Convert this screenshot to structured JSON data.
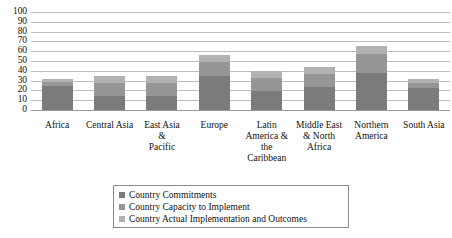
{
  "chart_data": {
    "type": "bar",
    "subtype": "stacked-bar",
    "title": "",
    "xlabel": "",
    "ylabel": "",
    "ylim": [
      0,
      100
    ],
    "y_ticks": [
      0,
      10,
      20,
      30,
      40,
      50,
      60,
      70,
      80,
      90,
      100
    ],
    "grid": true,
    "legend_position": "bottom",
    "categories": [
      "Africa",
      "Central Asia",
      "East Asia & Pacific",
      "Europe",
      "Latin America & the Caribbean",
      "Middle East & North Africa",
      "Northern America",
      "South Asia"
    ],
    "category_labels_wrapped": [
      "Africa",
      "Central Asia",
      "East Asia\n&\nPacific",
      "Europe",
      "Latin\nAmerica &\nthe\nCaribbean",
      "Middle East\n& North\nAfrica",
      "Northern\nAmerica",
      "South Asia"
    ],
    "series": [
      {
        "name": "Country Commitments",
        "color": "#7b7b7b",
        "values": [
          24,
          14,
          14,
          35,
          19,
          23,
          38,
          22
        ]
      },
      {
        "name": "Country Capacity to Implement",
        "color": "#969696",
        "values": [
          5,
          14,
          14,
          14,
          14,
          14,
          19,
          6
        ]
      },
      {
        "name": "Country Actual Implementation and Outcomes",
        "color": "#b2b2b2",
        "values": [
          3,
          7,
          7,
          7,
          7,
          7,
          8,
          4
        ]
      }
    ],
    "totals": [
      32,
      35,
      35,
      56,
      40,
      44,
      65,
      32
    ]
  },
  "legend": {
    "items": [
      {
        "label": "Country Commitments",
        "color": "#7b7b7b"
      },
      {
        "label": "Country Capacity to Implement",
        "color": "#969696"
      },
      {
        "label": "Country Actual Implementation and Outcomes",
        "color": "#b2b2b2"
      }
    ]
  },
  "colors": {
    "gridline": "#bdbdbd",
    "baseline": "#9a9a9a",
    "background": "#ffffff",
    "text": "#111111",
    "legend_border": "#8a8a8a"
  }
}
